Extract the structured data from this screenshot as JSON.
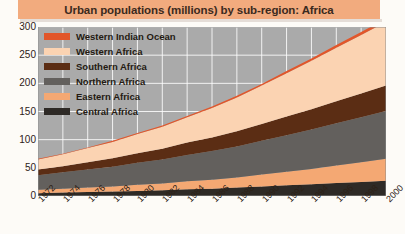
{
  "title": "Urban populations (millions) by sub-region: Africa",
  "legend": {
    "items": [
      {
        "label": "Western Indian Ocean",
        "color": "#e2562a",
        "swatch_name": "legend-swatch-western-indian-ocean"
      },
      {
        "label": "Western Africa",
        "color": "#fbd3b2",
        "swatch_name": "legend-swatch-western-africa"
      },
      {
        "label": "Southern Africa",
        "color": "#5b2d14",
        "swatch_name": "legend-swatch-southern-africa"
      },
      {
        "label": "Northern Africa",
        "color": "#63605d",
        "swatch_name": "legend-swatch-northern-africa"
      },
      {
        "label": "Eastern Africa",
        "color": "#f4a873",
        "swatch_name": "legend-swatch-eastern-africa"
      },
      {
        "label": "Central Africa",
        "color": "#2e2a26",
        "swatch_name": "legend-swatch-central-africa"
      }
    ]
  },
  "colors": {
    "title_bar": "#f2ab7e",
    "plot_background": "#aaaaaa",
    "gridline": "#ffffff",
    "page_background": "#fdfbf7",
    "text": "#2d2117"
  },
  "chart_data": {
    "type": "area",
    "stacked": true,
    "title": "Urban populations (millions) by sub-region: Africa",
    "xlabel": "",
    "ylabel": "",
    "ylim": [
      0,
      300
    ],
    "yticks": [
      0,
      50,
      100,
      150,
      200,
      250,
      300
    ],
    "grid": true,
    "legend_position": "top-left inside plot",
    "x": [
      1972,
      1974,
      1976,
      1978,
      1980,
      1982,
      1984,
      1986,
      1988,
      1990,
      1992,
      1994,
      1996,
      1998,
      2000
    ],
    "categories": [
      "1972",
      "1974",
      "1976",
      "1978",
      "1980",
      "1982",
      "1984",
      "1986",
      "1988",
      "1990",
      "1992",
      "1994",
      "1996",
      "1998",
      "2000"
    ],
    "stack_order_bottom_to_top": [
      "Central Africa",
      "Eastern Africa",
      "Northern Africa",
      "Southern Africa",
      "Western Africa",
      "Western Indian Ocean"
    ],
    "series": [
      {
        "name": "Central Africa",
        "color": "#2e2a26",
        "values": [
          5,
          6,
          7,
          8,
          9,
          10,
          12,
          13,
          15,
          17,
          19,
          21,
          23,
          25,
          27
        ]
      },
      {
        "name": "Eastern Africa",
        "color": "#f4a873",
        "values": [
          6,
          7,
          8,
          9,
          11,
          12,
          14,
          16,
          18,
          21,
          24,
          27,
          31,
          35,
          39
        ]
      },
      {
        "name": "Northern Africa",
        "color": "#63605d",
        "values": [
          26,
          29,
          32,
          35,
          39,
          43,
          47,
          51,
          55,
          60,
          65,
          70,
          75,
          80,
          85
        ]
      },
      {
        "name": "Southern Africa",
        "color": "#5b2d14",
        "values": [
          10,
          11,
          13,
          15,
          17,
          19,
          22,
          24,
          27,
          30,
          33,
          36,
          39,
          42,
          45
        ]
      },
      {
        "name": "Western Africa",
        "color": "#fbd3b2",
        "values": [
          18,
          21,
          25,
          29,
          34,
          39,
          45,
          52,
          60,
          68,
          77,
          86,
          95,
          104,
          113
        ]
      },
      {
        "name": "Western Indian Ocean",
        "color": "#e2562a",
        "values": [
          1,
          1,
          1,
          2,
          2,
          2,
          2,
          3,
          3,
          3,
          4,
          4,
          5,
          5,
          6
        ]
      }
    ],
    "totals": [
      66,
      75,
      86,
      98,
      112,
      125,
      142,
      159,
      178,
      199,
      222,
      244,
      268,
      291,
      315
    ]
  }
}
